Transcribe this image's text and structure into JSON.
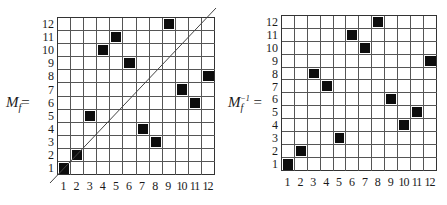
{
  "matrices": [
    {
      "id": "Mf",
      "label_main": "M",
      "label_sub": "f",
      "label_sup": "",
      "label_eq": "=",
      "size": 12,
      "x_ticks": [
        "1",
        "2",
        "3",
        "4",
        "5",
        "6",
        "7",
        "8",
        "9",
        "10",
        "11",
        "12"
      ],
      "y_ticks": [
        "1",
        "2",
        "3",
        "4",
        "5",
        "6",
        "7",
        "8",
        "9",
        "10",
        "11",
        "12"
      ],
      "filled_cells": [
        {
          "col": 1,
          "row": 1
        },
        {
          "col": 2,
          "row": 2
        },
        {
          "col": 3,
          "row": 5
        },
        {
          "col": 4,
          "row": 10
        },
        {
          "col": 5,
          "row": 11
        },
        {
          "col": 6,
          "row": 9
        },
        {
          "col": 7,
          "row": 4
        },
        {
          "col": 8,
          "row": 3
        },
        {
          "col": 9,
          "row": 12
        },
        {
          "col": 10,
          "row": 7
        },
        {
          "col": 11,
          "row": 6
        },
        {
          "col": 12,
          "row": 8
        }
      ],
      "diagonal_line": true
    },
    {
      "id": "Mf_inv",
      "label_main": "M",
      "label_sub": "f",
      "label_sup": "−1",
      "label_eq": " =",
      "size": 12,
      "x_ticks": [
        "1",
        "2",
        "3",
        "4",
        "5",
        "6",
        "7",
        "8",
        "9",
        "10",
        "11",
        "12"
      ],
      "y_ticks": [
        "1",
        "2",
        "3",
        "4",
        "5",
        "6",
        "7",
        "8",
        "9",
        "10",
        "11",
        "12"
      ],
      "filled_cells": [
        {
          "col": 1,
          "row": 1
        },
        {
          "col": 2,
          "row": 2
        },
        {
          "col": 3,
          "row": 8
        },
        {
          "col": 4,
          "row": 7
        },
        {
          "col": 5,
          "row": 3
        },
        {
          "col": 6,
          "row": 11
        },
        {
          "col": 7,
          "row": 10
        },
        {
          "col": 8,
          "row": 12
        },
        {
          "col": 9,
          "row": 6
        },
        {
          "col": 10,
          "row": 4
        },
        {
          "col": 11,
          "row": 5
        },
        {
          "col": 12,
          "row": 9
        }
      ],
      "diagonal_line": false
    }
  ],
  "colors": {
    "filled": "#0d0d0d",
    "grid": "#555555",
    "background": "#ffffff"
  }
}
